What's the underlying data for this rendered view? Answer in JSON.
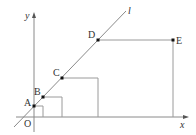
{
  "diagram": {
    "type": "coordinate-geometry",
    "axes": {
      "x_label": "x",
      "y_label": "y",
      "origin_label": "O"
    },
    "line_label": "l",
    "points": [
      {
        "label": "A",
        "px": [
          34,
          106
        ]
      },
      {
        "label": "B",
        "px": [
          43,
          97
        ]
      },
      {
        "label": "C",
        "px": [
          62,
          78
        ]
      },
      {
        "label": "D",
        "px": [
          98,
          40
        ]
      },
      {
        "label": "E",
        "px": [
          173,
          40
        ]
      }
    ],
    "colors": {
      "stroke": "#888888",
      "point": "#111111",
      "text": "#333333"
    }
  }
}
